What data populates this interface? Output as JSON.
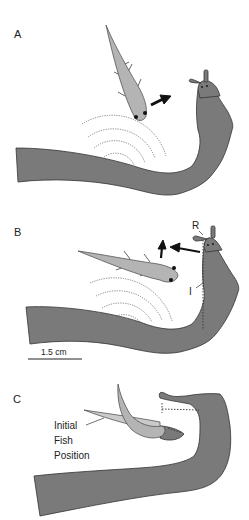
{
  "figure": {
    "panels": [
      {
        "id": "A",
        "label": "A"
      },
      {
        "id": "B",
        "label": "B"
      },
      {
        "id": "C",
        "label": "C"
      }
    ],
    "annotations": {
      "R_label": "R",
      "I_label": "I",
      "scale_bar": "1.5 cm",
      "initial_fish_position_line1": "Initial",
      "initial_fish_position_line2": "Fish",
      "initial_fish_position_line3": "Position"
    },
    "colors": {
      "predator_body": "#7a7a7a",
      "fish_body": "#b4b4b4",
      "outline": "#333333",
      "ripples": "#777777",
      "arrows": "#111111",
      "background": "#ffffff"
    }
  }
}
